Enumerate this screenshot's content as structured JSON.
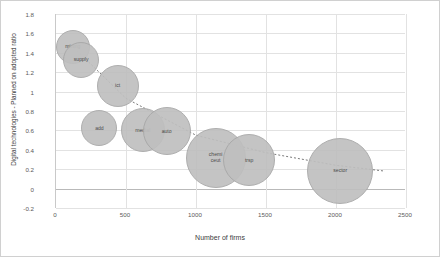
{
  "chart_data": {
    "type": "scatter",
    "title": "",
    "xlabel": "Number of firms",
    "ylabel": "Digital technologies - Planned on adopted ratio",
    "xlim": [
      0,
      2500
    ],
    "ylim": [
      -0.2,
      1.8
    ],
    "xticks": [
      0,
      500,
      1000,
      1500,
      2000,
      2500
    ],
    "yticks": [
      -0.2,
      0,
      0.2,
      0.4,
      0.6,
      0.8,
      1,
      1.2,
      1.4,
      1.6,
      1.8
    ],
    "grid": true,
    "legend": "none",
    "bubble_size_note": "bubble area encodes a third variable",
    "points": [
      {
        "label": "mining",
        "x": 120,
        "y": 1.46,
        "size": 34
      },
      {
        "label": "supply",
        "x": 180,
        "y": 1.33,
        "size": 36
      },
      {
        "label": "ict",
        "x": 440,
        "y": 1.06,
        "size": 42
      },
      {
        "label": "add",
        "x": 310,
        "y": 0.62,
        "size": 36
      },
      {
        "label": "mediaI",
        "x": 620,
        "y": 0.6,
        "size": 44
      },
      {
        "label": "auto",
        "x": 790,
        "y": 0.59,
        "size": 48
      },
      {
        "label": "chemi\nceut",
        "x": 1140,
        "y": 0.32,
        "size": 60
      },
      {
        "label": "trsp",
        "x": 1380,
        "y": 0.29,
        "size": 52
      },
      {
        "label": "sector",
        "x": 2030,
        "y": 0.18,
        "size": 66
      }
    ],
    "trend": {
      "type": "dotted",
      "points": [
        {
          "x": 130,
          "y": 1.45
        },
        {
          "x": 500,
          "y": 0.93
        },
        {
          "x": 1000,
          "y": 0.55
        },
        {
          "x": 1500,
          "y": 0.37
        },
        {
          "x": 2000,
          "y": 0.24
        },
        {
          "x": 2350,
          "y": 0.18
        }
      ]
    },
    "colors": {
      "bubble_fill": "#bfbfbf",
      "bubble_stroke": "#a8a8a8",
      "grid": "#e2e2e2",
      "axis": "#b9b9b9",
      "text": "#5a5a5a",
      "trend": "#7a7a7a"
    }
  },
  "yticklabels": [
    "1.8",
    "1.6",
    "1.4",
    "1.2",
    "1",
    "0.8",
    "0.6",
    "0.4",
    "0.2",
    "0",
    "-0.2"
  ],
  "xticklabels": [
    "0",
    "500",
    "1000",
    "1500",
    "2000",
    "2500"
  ]
}
